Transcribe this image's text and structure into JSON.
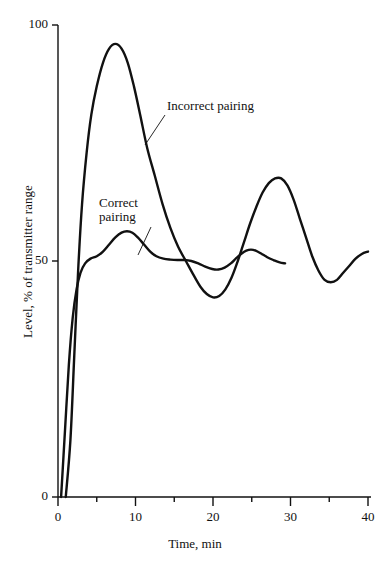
{
  "chart_data": {
    "type": "line",
    "title": "",
    "subtitle": "",
    "xlabel": "Time, min",
    "ylabel": "Level, % of transmitter range",
    "xlim": [
      0,
      40
    ],
    "ylim": [
      0,
      100
    ],
    "xticks": [
      0,
      10,
      20,
      30,
      40
    ],
    "xtick_labels": [
      "0",
      "10",
      "20",
      "30",
      "40"
    ],
    "xminor_ticks": [
      5,
      15,
      25,
      35
    ],
    "yticks": [
      0,
      50,
      100
    ],
    "ytick_labels": [
      "0",
      "50",
      "100"
    ],
    "grid": false,
    "legend": "inline-annotations",
    "line_color": "#111111",
    "background": "#ffffff",
    "series": [
      {
        "name": "Incorrect pairing",
        "label_text": "Incorrect pairing",
        "points": [
          [
            1.0,
            0
          ],
          [
            1.6,
            12
          ],
          [
            2.1,
            30
          ],
          [
            2.6,
            48
          ],
          [
            3.1,
            62
          ],
          [
            3.7,
            73
          ],
          [
            4.3,
            81
          ],
          [
            5.0,
            87
          ],
          [
            5.8,
            92
          ],
          [
            6.6,
            95
          ],
          [
            7.4,
            96
          ],
          [
            8.2,
            95
          ],
          [
            9.0,
            92
          ],
          [
            9.8,
            87
          ],
          [
            10.6,
            81
          ],
          [
            11.5,
            74
          ],
          [
            12.5,
            68
          ],
          [
            13.5,
            62
          ],
          [
            14.5,
            57
          ],
          [
            15.5,
            53
          ],
          [
            16.5,
            50
          ],
          [
            17.5,
            47
          ],
          [
            18.4,
            44.5
          ],
          [
            19.2,
            43
          ],
          [
            20.0,
            42.3
          ],
          [
            20.8,
            42.6
          ],
          [
            21.6,
            44
          ],
          [
            22.4,
            46.5
          ],
          [
            23.2,
            50
          ],
          [
            24.0,
            54
          ],
          [
            24.8,
            58
          ],
          [
            25.6,
            61.5
          ],
          [
            26.4,
            64.5
          ],
          [
            27.2,
            66.5
          ],
          [
            28.0,
            67.5
          ],
          [
            28.8,
            67.5
          ],
          [
            29.6,
            66
          ],
          [
            30.4,
            63
          ],
          [
            31.2,
            59
          ],
          [
            32.0,
            55
          ],
          [
            32.8,
            51
          ],
          [
            33.6,
            48
          ],
          [
            34.4,
            46
          ],
          [
            35.2,
            45.5
          ],
          [
            36.0,
            46
          ],
          [
            36.8,
            47.5
          ],
          [
            37.6,
            49
          ],
          [
            38.4,
            50.5
          ],
          [
            39.2,
            51.5
          ],
          [
            40.0,
            52
          ]
        ]
      },
      {
        "name": "Correct pairing",
        "label_text_line1": "Correct",
        "label_text_line2": "pairing",
        "points": [
          [
            0.4,
            0
          ],
          [
            0.9,
            14
          ],
          [
            1.4,
            28
          ],
          [
            1.9,
            38
          ],
          [
            2.4,
            44
          ],
          [
            2.9,
            47.5
          ],
          [
            3.5,
            49.5
          ],
          [
            4.2,
            50.5
          ],
          [
            5.0,
            51
          ],
          [
            5.8,
            52
          ],
          [
            6.6,
            53.5
          ],
          [
            7.4,
            55
          ],
          [
            8.2,
            56
          ],
          [
            8.9,
            56.3
          ],
          [
            9.6,
            56
          ],
          [
            10.3,
            55
          ],
          [
            11.1,
            53.5
          ],
          [
            11.9,
            52
          ],
          [
            12.7,
            51
          ],
          [
            13.6,
            50.5
          ],
          [
            14.5,
            50.3
          ],
          [
            15.4,
            50.2
          ],
          [
            16.3,
            50.2
          ],
          [
            17.2,
            50.0
          ],
          [
            18.1,
            49.5
          ],
          [
            19.0,
            48.8
          ],
          [
            19.9,
            48.3
          ],
          [
            20.7,
            48.2
          ],
          [
            21.5,
            48.6
          ],
          [
            22.3,
            49.5
          ],
          [
            23.0,
            50.6
          ],
          [
            23.7,
            51.6
          ],
          [
            24.3,
            52.2
          ],
          [
            24.9,
            52.4
          ],
          [
            25.5,
            52.2
          ],
          [
            26.2,
            51.6
          ],
          [
            27.0,
            50.8
          ],
          [
            27.8,
            50.2
          ],
          [
            28.6,
            49.7
          ],
          [
            29.3,
            49.5
          ]
        ]
      }
    ],
    "annotations": [
      {
        "text": "Incorrect pairing",
        "label_x_px": 167,
        "label_y_px": 99,
        "leader_from_px": [
          165,
          115
        ],
        "leader_to_px": [
          145,
          145
        ]
      },
      {
        "text": "Correct pairing",
        "label_x_px": 99,
        "label_y_px": 196,
        "leader_from_px": [
          151,
          227
        ],
        "leader_to_px": [
          138,
          255
        ]
      }
    ]
  }
}
